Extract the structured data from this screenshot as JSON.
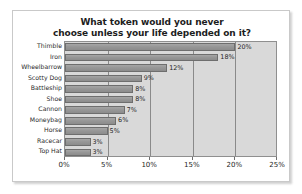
{
  "chart_data": {
    "type": "bar",
    "orientation": "horizontal",
    "title": "What token would you never choose unless your life depended on it?",
    "title_lines": [
      "What token would you never",
      "choose unless your life depended on it?"
    ],
    "categories": [
      "Thimble",
      "Iron",
      "Wheelbarrow",
      "Scotty Dog",
      "Battleship",
      "Shoe",
      "Cannon",
      "Moneybag",
      "Horse",
      "Racecar",
      "Top Hat"
    ],
    "values": [
      20,
      18,
      12,
      9,
      8,
      8,
      7,
      6,
      5,
      3,
      3
    ],
    "data_labels": [
      "20%",
      "18%",
      "12%",
      "9%",
      "8%",
      "8%",
      "7%",
      "6%",
      "5%",
      "3%",
      "3%"
    ],
    "xlabel": "",
    "ylabel": "",
    "xlim": [
      0,
      25
    ],
    "xticks": [
      0,
      5,
      10,
      15,
      20,
      25
    ],
    "xtick_labels": [
      "0%",
      "5%",
      "10%",
      "15%",
      "20%",
      "25%"
    ],
    "grid": true,
    "grid_axis": "x",
    "legend": false,
    "colors": {
      "bar_fill": "#979797",
      "bar_border": "#6e6e6e",
      "plot_background": "#d9d9d9",
      "gridline": "#8a8a8a",
      "plot_border": "#8f8f8f",
      "frame_background": "#ffffff",
      "frame_border": "#c9c9c9",
      "title_text": "#1d1d1d",
      "label_text": "#2a2a2a"
    }
  }
}
